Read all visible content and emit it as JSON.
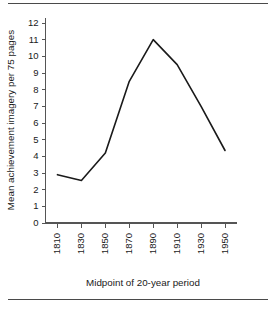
{
  "chart_data": {
    "type": "line",
    "title": "",
    "xlabel": "Midpoint of 20-year period",
    "ylabel": "Mean achievement imagery per 75 pages",
    "categories": [
      "1810",
      "1830",
      "1850",
      "1870",
      "1890",
      "1910",
      "1930",
      "1950"
    ],
    "x": [
      1810,
      1830,
      1850,
      1870,
      1890,
      1910,
      1930,
      1950
    ],
    "values": [
      2.9,
      2.55,
      4.2,
      8.5,
      11.0,
      9.5,
      7.0,
      4.35
    ],
    "xtick_labels": [
      "1810",
      "1830",
      "1850",
      "1870",
      "1890",
      "1910",
      "1930",
      "1950"
    ],
    "ytick_labels": [
      "0",
      "1",
      "2",
      "3",
      "4",
      "5",
      "6",
      "7",
      "8",
      "9",
      "10",
      "11",
      "12"
    ],
    "ytick_values": [
      0,
      1,
      2,
      3,
      4,
      5,
      6,
      7,
      8,
      9,
      10,
      11,
      12
    ],
    "ylim": [
      0,
      12
    ],
    "xlim": [
      1800,
      1960
    ],
    "grid": false,
    "legend": false,
    "legend_position": "none",
    "line_color": "#1a1a1a",
    "axis_color": "#555555",
    "background_color": "#ffffff",
    "xtick_rotation": 90
  },
  "figure": {
    "top_rule": "",
    "bottom_rule": ""
  }
}
